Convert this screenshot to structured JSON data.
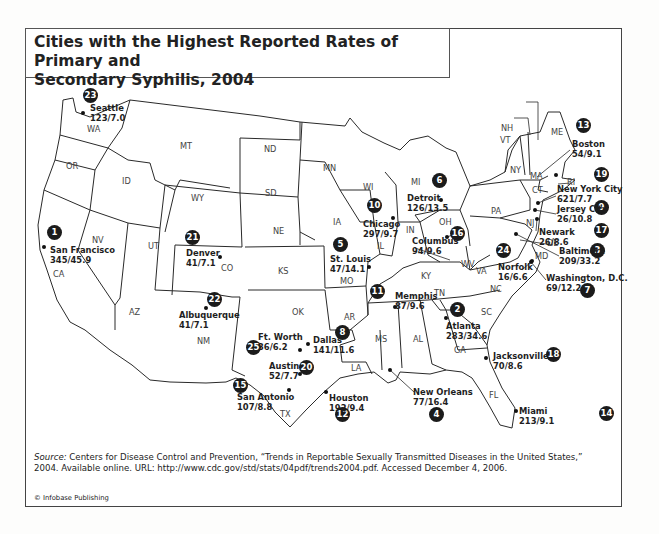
{
  "title": "Cities with the Highest Reported Rates of Primary and Secondary Syphilis, 2004",
  "title_lines": [
    "Cities with the Highest Reported Rates of Primary and",
    "Secondary Syphilis, 2004"
  ],
  "source": {
    "label": "Source:",
    "text": " Centers for Disease Control and Prevention, “Trends in Reportable Sexually Transmitted Diseases in the United States,” 2004. Available online. URL: http://www.cdc.gov/std/stats/04pdf/trends2004.pdf. Accessed December 4, 2006."
  },
  "copyright": "© Infobase Publishing",
  "states": [
    {
      "abbr": "WA",
      "x": 93,
      "y": 129
    },
    {
      "abbr": "OR",
      "x": 72,
      "y": 166
    },
    {
      "abbr": "CA",
      "x": 59,
      "y": 274
    },
    {
      "abbr": "NV",
      "x": 98,
      "y": 240
    },
    {
      "abbr": "ID",
      "x": 128,
      "y": 181
    },
    {
      "abbr": "MT",
      "x": 186,
      "y": 146
    },
    {
      "abbr": "WY",
      "x": 197,
      "y": 198
    },
    {
      "abbr": "UT",
      "x": 154,
      "y": 246
    },
    {
      "abbr": "CO",
      "x": 227,
      "y": 268
    },
    {
      "abbr": "AZ",
      "x": 135,
      "y": 312
    },
    {
      "abbr": "NM",
      "x": 203,
      "y": 341
    },
    {
      "abbr": "ND",
      "x": 270,
      "y": 149
    },
    {
      "abbr": "SD",
      "x": 271,
      "y": 193
    },
    {
      "abbr": "NE",
      "x": 279,
      "y": 231
    },
    {
      "abbr": "KS",
      "x": 284,
      "y": 271
    },
    {
      "abbr": "OK",
      "x": 298,
      "y": 312
    },
    {
      "abbr": "TX",
      "x": 286,
      "y": 414
    },
    {
      "abbr": "MN",
      "x": 329,
      "y": 168
    },
    {
      "abbr": "IA",
      "x": 339,
      "y": 222
    },
    {
      "abbr": "MO",
      "x": 346,
      "y": 281
    },
    {
      "abbr": "AR",
      "x": 350,
      "y": 317
    },
    {
      "abbr": "LA",
      "x": 357,
      "y": 368
    },
    {
      "abbr": "WI",
      "x": 369,
      "y": 187
    },
    {
      "abbr": "IL",
      "x": 383,
      "y": 246
    },
    {
      "abbr": "MS",
      "x": 381,
      "y": 339
    },
    {
      "abbr": "MI",
      "x": 417,
      "y": 182
    },
    {
      "abbr": "IN",
      "x": 412,
      "y": 230
    },
    {
      "abbr": "KY",
      "x": 427,
      "y": 276
    },
    {
      "abbr": "TN",
      "x": 440,
      "y": 293
    },
    {
      "abbr": "AL",
      "x": 419,
      "y": 339
    },
    {
      "abbr": "GA",
      "x": 460,
      "y": 350
    },
    {
      "abbr": "FL",
      "x": 495,
      "y": 395
    },
    {
      "abbr": "OH",
      "x": 445,
      "y": 222
    },
    {
      "abbr": "WV",
      "x": 467,
      "y": 264
    },
    {
      "abbr": "VA",
      "x": 482,
      "y": 271
    },
    {
      "abbr": "NC",
      "x": 496,
      "y": 289
    },
    {
      "abbr": "SC",
      "x": 487,
      "y": 312
    },
    {
      "abbr": "PA",
      "x": 497,
      "y": 211
    },
    {
      "abbr": "NY",
      "x": 516,
      "y": 170
    },
    {
      "abbr": "ME",
      "x": 557,
      "y": 132
    },
    {
      "abbr": "MA",
      "x": 536,
      "y": 176
    },
    {
      "abbr": "CT",
      "x": 538,
      "y": 190
    },
    {
      "abbr": "RI",
      "x": 573,
      "y": 182
    },
    {
      "abbr": "NJ",
      "x": 532,
      "y": 223
    },
    {
      "abbr": "DE",
      "x": 553,
      "y": 243
    },
    {
      "abbr": "MD",
      "x": 541,
      "y": 256
    },
    {
      "abbr": "NH",
      "x": 507,
      "y": 128
    },
    {
      "abbr": "VT",
      "x": 506,
      "y": 140
    }
  ],
  "cities": [
    {
      "rank": "1",
      "name": "San Francisco",
      "stats": "345/45.9",
      "badge": {
        "x": 54,
        "y": 232
      },
      "label": {
        "x": 50,
        "y": 249
      },
      "dot": {
        "x": 44,
        "y": 247
      }
    },
    {
      "rank": "2",
      "name": "Atlanta",
      "stats": "283/34.6",
      "badge": {
        "x": 457,
        "y": 309
      },
      "label": {
        "x": 446,
        "y": 325
      },
      "dot": {
        "x": 446,
        "y": 318
      }
    },
    {
      "rank": "3",
      "name": "Baltimore",
      "stats": "209/33.2",
      "badge": {
        "x": 597,
        "y": 250
      },
      "label": {
        "x": 559,
        "y": 250
      },
      "dot": {
        "x": 516,
        "y": 234
      }
    },
    {
      "rank": "4",
      "name": "New Orleans",
      "stats": "77/16.4",
      "badge": {
        "x": 436,
        "y": 414
      },
      "label": {
        "x": 413,
        "y": 391
      },
      "dot": {
        "x": 390,
        "y": 370
      }
    },
    {
      "rank": "5",
      "name": "St. Louis",
      "stats": "47/14.1",
      "badge": {
        "x": 340,
        "y": 244
      },
      "label": {
        "x": 330,
        "y": 258
      },
      "dot": {
        "x": 369,
        "y": 267
      }
    },
    {
      "rank": "6",
      "name": "Detroit",
      "stats": "126/13.5",
      "badge": {
        "x": 439,
        "y": 180
      },
      "label": {
        "x": 407,
        "y": 197
      },
      "dot": {
        "x": 441,
        "y": 200
      }
    },
    {
      "rank": "7",
      "name": "Washington, D.C.",
      "stats": "69/12.2",
      "badge": {
        "x": 587,
        "y": 290
      },
      "label": {
        "x": 546,
        "y": 277
      },
      "dot": {
        "x": 531,
        "y": 262
      }
    },
    {
      "rank": "8",
      "name": "Dallas",
      "stats": "141/11.6",
      "badge": {
        "x": 342,
        "y": 332
      },
      "label": {
        "x": 313,
        "y": 339
      },
      "dot": {
        "x": 308,
        "y": 344
      }
    },
    {
      "rank": "9",
      "name": "Jersey City",
      "stats": "26/10.8",
      "badge": {
        "x": 601,
        "y": 207
      },
      "label": {
        "x": 557,
        "y": 208
      },
      "dot": {
        "x": 535,
        "y": 210
      }
    },
    {
      "rank": "10",
      "name": "Chicago",
      "stats": "297/9.7",
      "badge": {
        "x": 374,
        "y": 205
      },
      "label": {
        "x": 363,
        "y": 223
      },
      "dot": {
        "x": 393,
        "y": 218
      }
    },
    {
      "rank": "11",
      "name": "Memphis",
      "stats": "87/9.6",
      "badge": {
        "x": 377,
        "y": 291
      },
      "label": {
        "x": 395,
        "y": 295
      },
      "dot": {
        "x": 395,
        "y": 307
      }
    },
    {
      "rank": "12",
      "name": "Houston",
      "stats": "192/9.4",
      "badge": {
        "x": 342,
        "y": 414
      },
      "label": {
        "x": 329,
        "y": 397
      },
      "dot": {
        "x": 326,
        "y": 392
      }
    },
    {
      "rank": "13",
      "name": "Boston",
      "stats": "54/9.1",
      "badge": {
        "x": 583,
        "y": 125
      },
      "label": {
        "x": 572,
        "y": 143
      },
      "dot": {
        "x": 556,
        "y": 175
      }
    },
    {
      "rank": "14",
      "name": "Miami",
      "stats": "213/9.1",
      "badge": {
        "x": 658,
        "y": 413
      },
      "label": {
        "x": 519,
        "y": 410
      },
      "dot": {
        "x": 516,
        "y": 411
      }
    },
    {
      "rank": "15",
      "name": "San Antonio",
      "stats": "107/8.8",
      "badge": {
        "x": 240,
        "y": 385
      },
      "label": {
        "x": 237,
        "y": 396
      },
      "dot": {
        "x": 289,
        "y": 390
      }
    },
    {
      "rank": "16",
      "name": "Columbus",
      "stats": "94/9.6",
      "badge": {
        "x": 457,
        "y": 233
      },
      "label": {
        "x": 412,
        "y": 240
      },
      "dot": {
        "x": 447,
        "y": 237
      }
    },
    {
      "rank": "17",
      "name": "Newark",
      "stats": "26/8.6",
      "badge": {
        "x": 601,
        "y": 230
      },
      "label": {
        "x": 539,
        "y": 231
      },
      "dot": {
        "x": 537,
        "y": 219
      }
    },
    {
      "rank": "18",
      "name": "Jacksonville",
      "stats": "70/8.6",
      "badge": {
        "x": 553,
        "y": 354
      },
      "label": {
        "x": 493,
        "y": 355
      },
      "dot": {
        "x": 486,
        "y": 358
      }
    },
    {
      "rank": "19",
      "name": "New York City",
      "stats": "621/7.7",
      "badge": {
        "x": 601,
        "y": 174
      },
      "label": {
        "x": 557,
        "y": 188
      },
      "dot": {
        "x": 538,
        "y": 203
      }
    },
    {
      "rank": "20",
      "name": "Austin",
      "stats": "52/7.7",
      "badge": {
        "x": 306,
        "y": 367
      },
      "label": {
        "x": 269,
        "y": 365
      },
      "dot": {
        "x": 300,
        "y": 374
      }
    },
    {
      "rank": "21",
      "name": "Denver",
      "stats": "41/7.1",
      "badge": {
        "x": 192,
        "y": 237
      },
      "label": {
        "x": 186,
        "y": 252
      },
      "dot": {
        "x": 220,
        "y": 257
      }
    },
    {
      "rank": "22",
      "name": "Albuquerque",
      "stats": "41/7.1",
      "badge": {
        "x": 214,
        "y": 299
      },
      "label": {
        "x": 179,
        "y": 314
      },
      "dot": {
        "x": 206,
        "y": 308
      }
    },
    {
      "rank": "23",
      "name": "Seattle",
      "stats": "123/7.0",
      "badge": {
        "x": 90,
        "y": 95
      },
      "label": {
        "x": 90,
        "y": 107
      },
      "dot": {
        "x": 83,
        "y": 113
      }
    },
    {
      "rank": "24",
      "name": "Norfolk",
      "stats": "16/6.6",
      "badge": {
        "x": 503,
        "y": 250
      },
      "label": {
        "x": 498,
        "y": 266
      },
      "dot": {
        "x": 532,
        "y": 261
      }
    },
    {
      "rank": "25",
      "name": "Ft. Worth",
      "stats": "36/6.2",
      "badge": {
        "x": 253,
        "y": 347
      },
      "label": {
        "x": 258,
        "y": 336
      },
      "dot": {
        "x": 300,
        "y": 350
      }
    }
  ],
  "chart_data": {
    "type": "table",
    "title": "Cities with the Highest Reported Rates of Primary and Secondary Syphilis, 2004",
    "columns": [
      "Rank",
      "City",
      "Cases",
      "Rate per 100,000"
    ],
    "label_format": "cases/rate",
    "rows": [
      [
        1,
        "San Francisco",
        345,
        45.9
      ],
      [
        2,
        "Atlanta",
        283,
        34.6
      ],
      [
        3,
        "Baltimore",
        209,
        33.2
      ],
      [
        4,
        "New Orleans",
        77,
        16.4
      ],
      [
        5,
        "St. Louis",
        47,
        14.1
      ],
      [
        6,
        "Detroit",
        126,
        13.5
      ],
      [
        7,
        "Washington, D.C.",
        69,
        12.2
      ],
      [
        8,
        "Dallas",
        141,
        11.6
      ],
      [
        9,
        "Jersey City",
        26,
        10.8
      ],
      [
        10,
        "Chicago",
        297,
        9.7
      ],
      [
        11,
        "Memphis",
        87,
        9.6
      ],
      [
        12,
        "Houston",
        192,
        9.4
      ],
      [
        13,
        "Boston",
        54,
        9.1
      ],
      [
        14,
        "Miami",
        213,
        9.1
      ],
      [
        15,
        "San Antonio",
        107,
        8.8
      ],
      [
        16,
        "Columbus",
        94,
        9.6
      ],
      [
        17,
        "Newark",
        26,
        8.6
      ],
      [
        18,
        "Jacksonville",
        70,
        8.6
      ],
      [
        19,
        "New York City",
        621,
        7.7
      ],
      [
        20,
        "Austin",
        52,
        7.7
      ],
      [
        21,
        "Denver",
        41,
        7.1
      ],
      [
        22,
        "Albuquerque",
        41,
        7.1
      ],
      [
        23,
        "Seattle",
        123,
        7.0
      ],
      [
        24,
        "Norfolk",
        16,
        6.6
      ],
      [
        25,
        "Ft. Worth",
        36,
        6.2
      ]
    ]
  }
}
